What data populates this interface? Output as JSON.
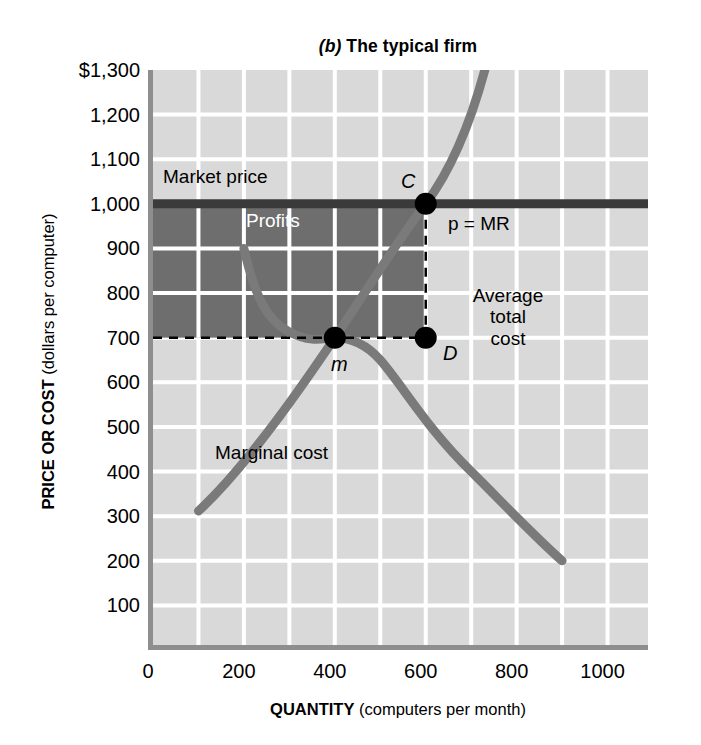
{
  "title": {
    "prefix": "(b)",
    "text": " The typical firm"
  },
  "axes": {
    "y_title_strong": "PRICE OR COST",
    "y_title_rest": " (dollars per computer)",
    "x_title_strong": "QUANTITY",
    "x_title_rest": " (computers per month)",
    "y_ticks": [
      "$1,300",
      "1,200",
      "1,100",
      "1,000",
      "900",
      "800",
      "700",
      "600",
      "500",
      "400",
      "300",
      "200",
      "100"
    ],
    "y_tick_values": [
      1300,
      1200,
      1100,
      1000,
      900,
      800,
      700,
      600,
      500,
      400,
      300,
      200,
      100
    ],
    "x_ticks": [
      "0",
      "200",
      "400",
      "600",
      "800",
      "1000"
    ],
    "x_tick_values": [
      0,
      200,
      400,
      600,
      800,
      1000
    ]
  },
  "annotations": {
    "market_price": "Market price",
    "profits": "Profits",
    "p_equals_mr_italic": "p",
    "p_equals_mr_rest": " = MR",
    "average_total_cost": "Average\ntotal\ncost",
    "marginal_cost": "Marginal cost",
    "point_c": "C",
    "point_d": "D",
    "point_m": "m"
  },
  "colors": {
    "plot_background": "#d9d9d9",
    "gridline": "#ffffff",
    "axis_border": "#8e8e8e",
    "curve": "#7a7a7a",
    "market_price_line": "#3a3a3a",
    "profit_shading": "#6e6e6e",
    "point_marker": "#000000",
    "page_background": "#ffffff"
  },
  "chart_data": {
    "type": "line",
    "title": "(b) The typical firm",
    "xlabel": "QUANTITY (computers per month)",
    "ylabel": "PRICE OR COST (dollars per computer)",
    "xlim": [
      0,
      1100
    ],
    "ylim": [
      0,
      1300
    ],
    "grid": true,
    "legend": "inline-annotations",
    "series": [
      {
        "name": "Marginal cost",
        "type": "line",
        "color": "#7a7a7a",
        "x": [
          100,
          200,
          300,
          400,
          500,
          600,
          700,
          730
        ],
        "y": [
          310,
          400,
          500,
          600,
          760,
          1000,
          1230,
          1300
        ]
      },
      {
        "name": "Average total cost",
        "type": "line",
        "color": "#7a7a7a",
        "x": [
          200,
          250,
          300,
          350,
          400,
          450,
          500,
          600,
          700,
          800,
          900
        ],
        "y": [
          900,
          760,
          680,
          625,
          600,
          608,
          630,
          700,
          800,
          930,
          1070
        ]
      },
      {
        "name": "p = MR (Market price)",
        "type": "hline",
        "color": "#3a3a3a",
        "y": 1000,
        "x": [
          0,
          1100
        ]
      }
    ],
    "points": [
      {
        "label": "C",
        "x": 600,
        "y": 1000,
        "note": "price equals marginal cost"
      },
      {
        "label": "D",
        "x": 600,
        "y": 700,
        "note": "average total cost at output"
      },
      {
        "label": "m",
        "x": 400,
        "y": 600,
        "note": "minimum of average total cost"
      }
    ],
    "shaded_region": {
      "label": "Profits",
      "x_range": [
        0,
        600
      ],
      "y_range": [
        700,
        1000
      ],
      "color": "#6e6e6e"
    },
    "dashed_guides": [
      {
        "type": "vertical",
        "x": 600,
        "y_range": [
          700,
          1000
        ]
      },
      {
        "type": "horizontal",
        "y": 700,
        "x_range": [
          0,
          600
        ]
      }
    ]
  }
}
